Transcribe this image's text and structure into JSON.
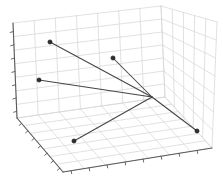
{
  "figure": {
    "title": "",
    "background": "#ffffff"
  },
  "chart_data": {
    "type": "scatter",
    "projection": "3d",
    "title": "",
    "xlabel": "",
    "ylabel": "",
    "zlabel": "",
    "legend": "none",
    "grid": true,
    "tick_labels_visible": false,
    "structure": "star-graph: line segments radiate from one central hub to five scatter points; only the five outer points have markers",
    "nodes_px": {
      "hub": {
        "x": 152,
        "y": 97,
        "marker": false
      },
      "points": [
        {
          "x": 50,
          "y": 42
        },
        {
          "x": 113,
          "y": 58
        },
        {
          "x": 39,
          "y": 80
        },
        {
          "x": 74,
          "y": 141
        },
        {
          "x": 197,
          "y": 131
        }
      ]
    },
    "edges": "hub-to-each-point",
    "box_px": {
      "z_spine": [
        [
          13,
          23
        ],
        [
          17,
          118
        ]
      ],
      "x_spine": [
        [
          17,
          118
        ],
        [
          63,
          172
        ]
      ],
      "y_spine": [
        [
          63,
          172
        ],
        [
          212,
          148
        ]
      ],
      "left_wall_quad": [
        [
          13,
          23
        ],
        [
          161,
          6
        ],
        [
          165,
          97
        ],
        [
          17,
          118
        ]
      ],
      "right_wall_quad": [
        [
          161,
          6
        ],
        [
          217,
          22
        ],
        [
          212,
          148
        ],
        [
          165,
          97
        ]
      ],
      "floor_quad": [
        [
          17,
          118
        ],
        [
          165,
          97
        ],
        [
          212,
          148
        ],
        [
          63,
          172
        ]
      ],
      "left_wall_grid": [
        7,
        7
      ],
      "right_wall_grid": [
        5,
        7
      ],
      "floor_grid": [
        7,
        7
      ]
    },
    "ticks": {
      "z": {
        "count": 7,
        "t_start": 0.09,
        "t_end": 0.93,
        "dir": [
          -3.2,
          0.9
        ]
      },
      "x": {
        "count": 7,
        "t_start": 0.1,
        "t_end": 0.93,
        "dir": [
          -2.4,
          2.0
        ]
      },
      "y": {
        "count": 8,
        "t_start": 0.055,
        "t_end": 0.9,
        "dir": [
          0.5,
          3.0
        ]
      }
    },
    "style": {
      "grid_color": "#d7d7d7",
      "grid_width": 0.75,
      "spine_color": "#5a5a5a",
      "spine_width": 1.1,
      "edge_line_color": "#454545",
      "edge_line_width": 1.05,
      "marker_fill": "#2e2e2e",
      "marker_edge": "#101010",
      "marker_radius": 2.1,
      "background": "#ffffff"
    },
    "canvas_px": {
      "width": 223,
      "height": 179
    }
  }
}
